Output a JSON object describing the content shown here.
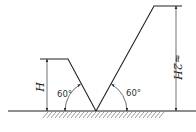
{
  "diagram": {
    "left_slope": {
      "height_label": "H",
      "angle_label": "60°"
    },
    "right_slope": {
      "height_label": "≈2H",
      "angle_label": "60°"
    },
    "ground": {
      "hatched": true
    }
  }
}
